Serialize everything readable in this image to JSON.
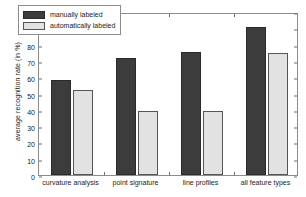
{
  "chart_data": {
    "type": "bar",
    "title": "",
    "xlabel": "",
    "ylabel": "average recognition rate (in %)",
    "categories": [
      "curvature analysis",
      "point signature",
      "line profiles",
      "all feature types"
    ],
    "series": [
      {
        "name": "manually labeled",
        "color": "#3c3c3c",
        "values": [
          58,
          71.5,
          75.5,
          91
        ]
      },
      {
        "name": "automatically labeled",
        "color": "#e2e2e2",
        "values": [
          52,
          39.5,
          39,
          75
        ]
      }
    ],
    "ylim": [
      0,
      100
    ],
    "ytick_labels": [
      "0",
      "10",
      "20",
      "30",
      "40",
      "50",
      "60",
      "70",
      "80",
      "90",
      "100"
    ],
    "ytick_values": [
      0,
      10,
      20,
      30,
      40,
      50,
      60,
      70,
      80,
      90,
      100
    ],
    "grid": false,
    "legend_position": "top-left"
  },
  "legend": {
    "items": [
      {
        "label": "manually labeled",
        "swatch": "dark-swatch"
      },
      {
        "label": "automatically labeled",
        "swatch": "light-swatch"
      }
    ]
  }
}
